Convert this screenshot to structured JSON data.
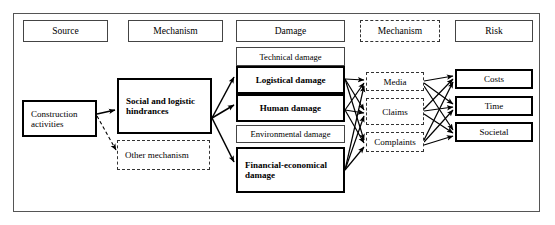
{
  "diagram": {
    "columns": [
      {
        "id": "source",
        "label": "Source",
        "style": "solid"
      },
      {
        "id": "mechanism1",
        "label": "Mechanism",
        "style": "solid"
      },
      {
        "id": "damage",
        "label": "Damage",
        "style": "solid"
      },
      {
        "id": "mechanism2",
        "label": "Mechanism",
        "style": "dashed"
      },
      {
        "id": "risk",
        "label": "Risk",
        "style": "solid"
      }
    ],
    "source_nodes": [
      {
        "id": "construction-activities",
        "label": "Construction activities",
        "style": "bold"
      }
    ],
    "mechanism1_nodes": [
      {
        "id": "social-logistic-hindrances",
        "label": "Social and logistic hindrances",
        "style": "bold"
      },
      {
        "id": "other-mechanism",
        "label": "Other mechanism",
        "style": "dashed"
      }
    ],
    "damage_nodes": [
      {
        "id": "technical-damage",
        "label": "Technical damage",
        "style": "thin"
      },
      {
        "id": "logistical-damage",
        "label": "Logistical damage",
        "style": "bold"
      },
      {
        "id": "human-damage",
        "label": "Human damage",
        "style": "bold"
      },
      {
        "id": "environmental-damage",
        "label": "Environmental damage",
        "style": "thin"
      },
      {
        "id": "financial-economical-damage",
        "label": "Financial-economical damage",
        "style": "bold"
      }
    ],
    "mechanism2_nodes": [
      {
        "id": "media",
        "label": "Media",
        "style": "dashed"
      },
      {
        "id": "claims",
        "label": "Claims",
        "style": "dashed"
      },
      {
        "id": "complaints",
        "label": "Complaints",
        "style": "dashed"
      }
    ],
    "risk_nodes": [
      {
        "id": "costs",
        "label": "Costs",
        "style": "bold"
      },
      {
        "id": "time",
        "label": "Time",
        "style": "bold"
      },
      {
        "id": "societal",
        "label": "Societal",
        "style": "bold"
      }
    ],
    "colors": {
      "line": "#000000",
      "frame": "#555555",
      "thin_border": "#444444",
      "dashed_border": "#333333",
      "background": "#ffffff"
    }
  }
}
